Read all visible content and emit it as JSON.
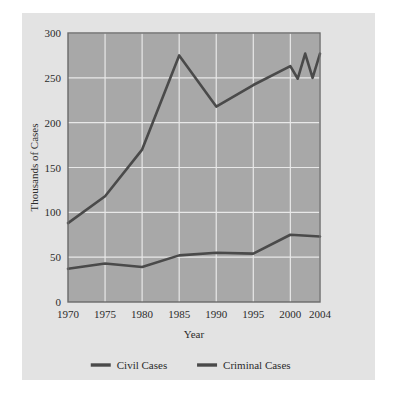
{
  "figure": {
    "background_color": "#e3e3e3",
    "page_background_color": "#ffffff"
  },
  "chart_data": {
    "type": "line",
    "title": "",
    "subtitle": "",
    "xlabel": "Year",
    "ylabel": "Thousands of Cases",
    "xlim": [
      1970,
      2004
    ],
    "ylim": [
      0,
      300
    ],
    "xticks": [
      1970,
      1975,
      1980,
      1985,
      1990,
      1995,
      2000,
      2004
    ],
    "xtick_labels": [
      "1970",
      "1975",
      "1980",
      "1985",
      "1990",
      "1995",
      "2000",
      "2004"
    ],
    "yticks": [
      0,
      50,
      100,
      150,
      200,
      250,
      300
    ],
    "ytick_labels": [
      "0",
      "50",
      "100",
      "150",
      "200",
      "250",
      "300"
    ],
    "grid": true,
    "grid_color": "#e8e8e8",
    "plot_background_color": "#a8a8a8",
    "plot_border_color": "#6a6a6a",
    "line_color": "#4a4a4a",
    "legend_position": "below",
    "series": [
      {
        "name": "Civil Cases",
        "color": "#4a4a4a",
        "x": [
          1970,
          1975,
          1980,
          1985,
          1990,
          1995,
          2000,
          2001,
          2002,
          2003,
          2004
        ],
        "values": [
          88,
          118,
          170,
          275,
          218,
          242,
          263,
          249,
          277,
          250,
          277
        ]
      },
      {
        "name": "Criminal Cases",
        "color": "#4a4a4a",
        "x": [
          1970,
          1975,
          1980,
          1985,
          1990,
          1995,
          2000,
          2004
        ],
        "values": [
          37,
          43,
          39,
          52,
          55,
          54,
          75,
          73
        ]
      }
    ]
  },
  "legend": {
    "items": [
      {
        "label": "Civil Cases",
        "color": "#4a4a4a"
      },
      {
        "label": "Criminal Cases",
        "color": "#4a4a4a"
      }
    ]
  }
}
